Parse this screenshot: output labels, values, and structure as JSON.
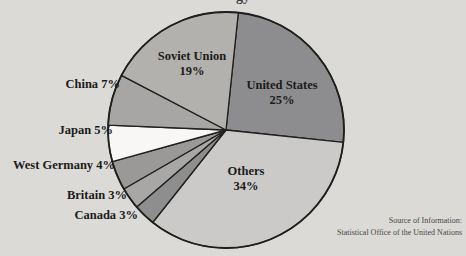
{
  "page": {
    "background_color": "#dbdad7",
    "text_color": "#1b1b1a"
  },
  "cropped_title_fragment": "gy",
  "chart_data": {
    "type": "pie",
    "title": "",
    "unit": "percent",
    "direction": "clockwise",
    "start_angle_deg": 6,
    "outline_color": "#1f1f1e",
    "center_x": 226,
    "center_y": 130,
    "radius": 118,
    "slices": [
      {
        "label": "United States",
        "value": 25,
        "pct": "25%",
        "color": "#8d8d90",
        "label_placement": "inside"
      },
      {
        "label": "Others",
        "value": 34,
        "pct": "34%",
        "color": "#cbcac8",
        "label_placement": "inside"
      },
      {
        "label": "Canada",
        "value": 3,
        "pct": "3%",
        "color": "#8f8e8e",
        "label_placement": "outside"
      },
      {
        "label": "Britain",
        "value": 3,
        "pct": "3%",
        "color": "#a8a7a5",
        "label_placement": "outside"
      },
      {
        "label": "West Germany",
        "value": 4,
        "pct": "4%",
        "color": "#9a9997",
        "label_placement": "outside"
      },
      {
        "label": "Japan",
        "value": 5,
        "pct": "5%",
        "color": "#f8f7f5",
        "label_placement": "outside"
      },
      {
        "label": "China",
        "value": 7,
        "pct": "7%",
        "color": "#a7a6a4",
        "label_placement": "outside"
      },
      {
        "label": "Soviet Union",
        "value": 19,
        "pct": "19%",
        "color": "#b2b1ae",
        "label_placement": "inside"
      }
    ],
    "source_note": {
      "line1": "Source of Information:",
      "line2": "Statistical Office of the United Nations"
    }
  }
}
